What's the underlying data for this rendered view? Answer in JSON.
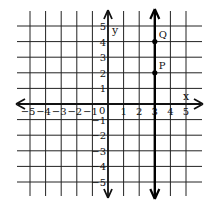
{
  "diagram": {
    "type": "coordinate-grid",
    "x_range": [
      -5,
      5
    ],
    "y_range": [
      -5,
      5
    ],
    "axis_labels": {
      "x": "x",
      "y": "y"
    },
    "origin_label": "0",
    "x_ticks": [
      "-5",
      "-4",
      "-3",
      "-2",
      "-1",
      "1",
      "2",
      "3",
      "4",
      "5"
    ],
    "y_ticks": [
      "5",
      "4",
      "3",
      "2",
      "1",
      "-1",
      "-2",
      "-3",
      "-4",
      "-5"
    ],
    "vertical_line": {
      "x": 3,
      "description": "x = 3"
    },
    "points": [
      {
        "label": "Q",
        "x": 3,
        "y": 4
      },
      {
        "label": "P",
        "x": 3,
        "y": 2
      }
    ],
    "colors": {
      "ink": "#111111",
      "background": "#ffffff"
    }
  }
}
